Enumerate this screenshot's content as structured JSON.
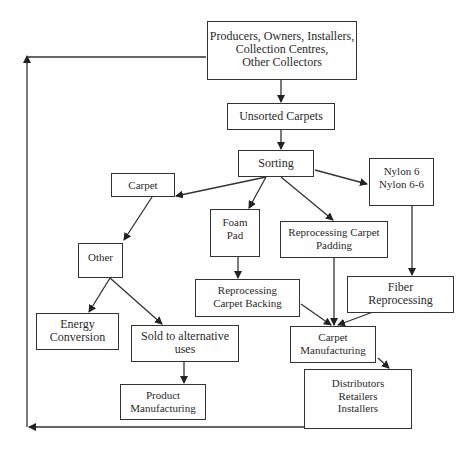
{
  "diagram": {
    "type": "flowchart",
    "title": "",
    "colors": {
      "line": "#333333",
      "background": "#ffffff",
      "text": "#2a2a2a"
    },
    "nodes": {
      "producers": {
        "lines": [
          "Producers, Owners, Installers,",
          "Collection Centres,",
          "Other Collectors"
        ]
      },
      "unsorted": {
        "lines": [
          "Unsorted Carpets"
        ]
      },
      "sorting": {
        "lines": [
          "Sorting"
        ]
      },
      "nylon": {
        "lines": [
          "Nylon 6",
          "Nylon 6-6"
        ]
      },
      "carpet": {
        "lines": [
          "Carpet"
        ]
      },
      "foam_pad": {
        "lines": [
          "Foam",
          "Pad"
        ]
      },
      "reproc_padding": {
        "lines": [
          "Reprocessing Carpet",
          "Padding"
        ]
      },
      "other": {
        "lines": [
          "Other"
        ]
      },
      "reproc_backing": {
        "lines": [
          "Reprocessing",
          "Carpet Backing"
        ]
      },
      "fiber_reproc": {
        "lines": [
          "Fiber",
          "Reprocessing"
        ]
      },
      "energy": {
        "lines": [
          "Energy",
          "Conversion"
        ]
      },
      "sold_alt": {
        "lines": [
          "Sold to alternative",
          "uses"
        ]
      },
      "carpet_mfg": {
        "lines": [
          "Carpet",
          "Manufacturing"
        ]
      },
      "distributors": {
        "lines": [
          "Distributors",
          "Retailers",
          "Installers"
        ]
      },
      "product_mfg": {
        "lines": [
          "Product",
          "Manufacturing"
        ]
      }
    },
    "edges": [
      {
        "from": "producers",
        "to": "unsorted"
      },
      {
        "from": "unsorted",
        "to": "sorting"
      },
      {
        "from": "sorting",
        "to": "carpet"
      },
      {
        "from": "sorting",
        "to": "foam_pad"
      },
      {
        "from": "sorting",
        "to": "reproc_padding"
      },
      {
        "from": "sorting",
        "to": "nylon"
      },
      {
        "from": "carpet",
        "to": "other"
      },
      {
        "from": "other",
        "to": "energy"
      },
      {
        "from": "other",
        "to": "sold_alt"
      },
      {
        "from": "sold_alt",
        "to": "product_mfg"
      },
      {
        "from": "foam_pad",
        "to": "reproc_backing"
      },
      {
        "from": "nylon",
        "to": "fiber_reproc"
      },
      {
        "from": "reproc_backing",
        "to": "carpet_mfg"
      },
      {
        "from": "reproc_padding",
        "to": "carpet_mfg"
      },
      {
        "from": "fiber_reproc",
        "to": "carpet_mfg"
      },
      {
        "from": "carpet_mfg",
        "to": "distributors"
      },
      {
        "from": "distributors",
        "to": "producers",
        "note": "return loop along left edge"
      }
    ]
  }
}
